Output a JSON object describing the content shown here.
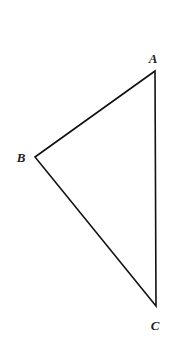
{
  "diagram": {
    "type": "triangle",
    "vertices": [
      {
        "id": "A",
        "label": "A",
        "x": 155,
        "y": 71,
        "label_x": 153,
        "label_y": 63
      },
      {
        "id": "B",
        "label": "B",
        "x": 35,
        "y": 157,
        "label_x": 21,
        "label_y": 162
      },
      {
        "id": "C",
        "label": "C",
        "x": 156,
        "y": 306,
        "label_x": 155,
        "label_y": 330
      }
    ],
    "edges": [
      [
        "A",
        "B"
      ],
      [
        "B",
        "C"
      ],
      [
        "C",
        "A"
      ]
    ],
    "stroke_color": "#111111",
    "label_color": "#222222"
  }
}
